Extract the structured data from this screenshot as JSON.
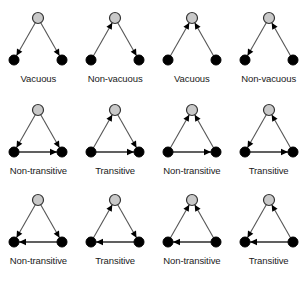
{
  "figure": {
    "columns": 4,
    "rows": 3,
    "colors": {
      "background": "#ffffff",
      "top_node_fill": "#c9c9c9",
      "top_node_stroke": "#333333",
      "bottom_node_fill": "#000000",
      "edge_stroke": "#555555",
      "bottom_edge_stroke": "#2b2b2b",
      "arrow_fill": "#000000",
      "label_color": "#1a1a1a"
    },
    "node_layout": {
      "top": {
        "x": 36,
        "y": 10,
        "r": 5.5
      },
      "bottom_left": {
        "x": 12,
        "y": 52,
        "r": 5
      },
      "bottom_right": {
        "x": 60,
        "y": 52,
        "r": 5
      }
    }
  },
  "rows": [
    {
      "id": "row-1",
      "bottom_edge": "none",
      "panels": [
        {
          "id": "r1c1",
          "label": "Vacuous",
          "left_edge_direction": "down",
          "right_edge_direction": "down",
          "bottom_edge_direction": "none"
        },
        {
          "id": "r1c2",
          "label": "Non-vacuous",
          "left_edge_direction": "up",
          "right_edge_direction": "down",
          "bottom_edge_direction": "none"
        },
        {
          "id": "r1c3",
          "label": "Vacuous",
          "left_edge_direction": "up",
          "right_edge_direction": "up",
          "bottom_edge_direction": "none"
        },
        {
          "id": "r1c4",
          "label": "Non-vacuous",
          "left_edge_direction": "down",
          "right_edge_direction": "up",
          "bottom_edge_direction": "none"
        }
      ]
    },
    {
      "id": "row-2",
      "bottom_edge": "left-to-right",
      "panels": [
        {
          "id": "r2c1",
          "label": "Non-transitive",
          "left_edge_direction": "down",
          "right_edge_direction": "down",
          "bottom_edge_direction": "right"
        },
        {
          "id": "r2c2",
          "label": "Transitive",
          "left_edge_direction": "up",
          "right_edge_direction": "down",
          "bottom_edge_direction": "right"
        },
        {
          "id": "r2c3",
          "label": "Non-transitive",
          "left_edge_direction": "up",
          "right_edge_direction": "up",
          "bottom_edge_direction": "right"
        },
        {
          "id": "r2c4",
          "label": "Transitive",
          "left_edge_direction": "down",
          "right_edge_direction": "up",
          "bottom_edge_direction": "right"
        }
      ]
    },
    {
      "id": "row-3",
      "bottom_edge": "right-to-left",
      "panels": [
        {
          "id": "r3c1",
          "label": "Non-transitive",
          "left_edge_direction": "down",
          "right_edge_direction": "down",
          "bottom_edge_direction": "left"
        },
        {
          "id": "r3c2",
          "label": "Transitive",
          "left_edge_direction": "up",
          "right_edge_direction": "down",
          "bottom_edge_direction": "left"
        },
        {
          "id": "r3c3",
          "label": "Non-transitive",
          "left_edge_direction": "up",
          "right_edge_direction": "up",
          "bottom_edge_direction": "left"
        },
        {
          "id": "r3c4",
          "label": "Transitive",
          "left_edge_direction": "down",
          "right_edge_direction": "up",
          "bottom_edge_direction": "left"
        }
      ]
    }
  ]
}
